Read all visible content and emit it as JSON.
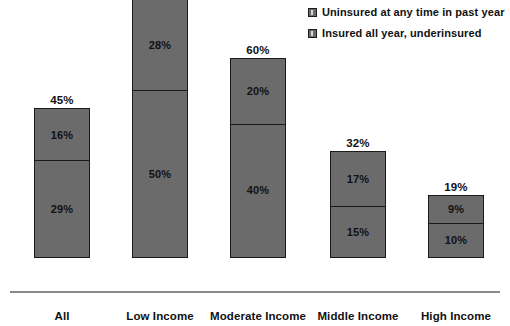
{
  "chart_data": {
    "type": "bar",
    "subtype": "stacked-bar",
    "title": "",
    "xlabel": "",
    "ylabel": "",
    "ylim": [
      0,
      80
    ],
    "grid": false,
    "legend_position": "top-right",
    "categories": [
      "All",
      "Low Income",
      "Moderate Income",
      "Middle Income",
      "High Income"
    ],
    "series": [
      {
        "name": "Uninsured at any time in past year",
        "values": [
          16,
          28,
          20,
          17,
          9
        ],
        "value_labels": [
          "16%",
          "28%",
          "20%",
          "17%",
          "9%"
        ],
        "color": "#6b6b6b"
      },
      {
        "name": "Insured all year, underinsured",
        "values": [
          29,
          50,
          40,
          15,
          10
        ],
        "value_labels": [
          "29%",
          "50%",
          "40%",
          "15%",
          "10%"
        ],
        "color": "#6b6b6b"
      }
    ],
    "totals": [
      45,
      78,
      60,
      32,
      19
    ],
    "total_labels": [
      "45%",
      "78%",
      "60%",
      "32%",
      "19%"
    ]
  },
  "legend": {
    "items": [
      {
        "label": "Uninsured at any time in past year",
        "swatch": "legend-swatch-uninsured"
      },
      {
        "label": "Insured all year, underinsured",
        "swatch": "legend-swatch-underinsured"
      }
    ]
  },
  "bars": [
    {
      "category": "All",
      "total_label": "45%",
      "top_label": "16%",
      "bottom_label": "29%",
      "total": 45,
      "top": 16,
      "bottom": 29
    },
    {
      "category": "Low Income",
      "total_label": "78%",
      "top_label": "28%",
      "bottom_label": "50%",
      "total": 78,
      "top": 28,
      "bottom": 50
    },
    {
      "category": "Moderate Income",
      "total_label": "60%",
      "top_label": "20%",
      "bottom_label": "40%",
      "total": 60,
      "top": 20,
      "bottom": 40
    },
    {
      "category": "Middle Income",
      "total_label": "32%",
      "top_label": "17%",
      "bottom_label": "15%",
      "total": 32,
      "top": 17,
      "bottom": 15
    },
    {
      "category": "High Income",
      "total_label": "19%",
      "top_label": "9%",
      "bottom_label": "10%",
      "total": 19,
      "top": 9,
      "bottom": 10
    }
  ],
  "style": {
    "bar_fill": "#6b6b6b",
    "bar_border": "#1a1a1a",
    "axis_color": "#8a8a8a",
    "text_color": "#111111",
    "background": "#ffffff"
  }
}
